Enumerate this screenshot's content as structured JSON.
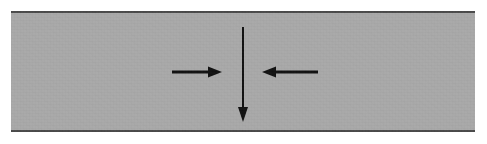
{
  "figure": {
    "canvas": {
      "width": 487,
      "height": 144,
      "background": "#ffffff"
    },
    "band": {
      "name": "gray-band",
      "description": "Horizontal shaded band representing a material layer or cross-section",
      "fill_color": "#a8a8a8",
      "border_color": "#4a4a4a",
      "x": 11,
      "y": 11,
      "width": 464,
      "height": 121,
      "border_top_thickness": 2,
      "border_bottom_thickness": 2
    },
    "arrows": [
      {
        "name": "down-arrow",
        "direction": "down",
        "label": "",
        "color": "#111111",
        "shaft_thickness": 2,
        "x_start": 243,
        "y_start": 27,
        "x_end": 243,
        "y_end": 122,
        "head_width": 10,
        "head_length": 15
      },
      {
        "name": "right-arrow",
        "direction": "right",
        "label": "",
        "color": "#111111",
        "shaft_thickness": 3,
        "x_start": 172,
        "y_start": 72,
        "x_end": 222,
        "y_end": 72,
        "head_width": 11,
        "head_length": 14
      },
      {
        "name": "left-arrow",
        "direction": "left",
        "label": "",
        "color": "#111111",
        "shaft_thickness": 3,
        "x_start": 318,
        "y_start": 72,
        "x_end": 262,
        "y_end": 72,
        "head_width": 11,
        "head_length": 14
      }
    ]
  }
}
